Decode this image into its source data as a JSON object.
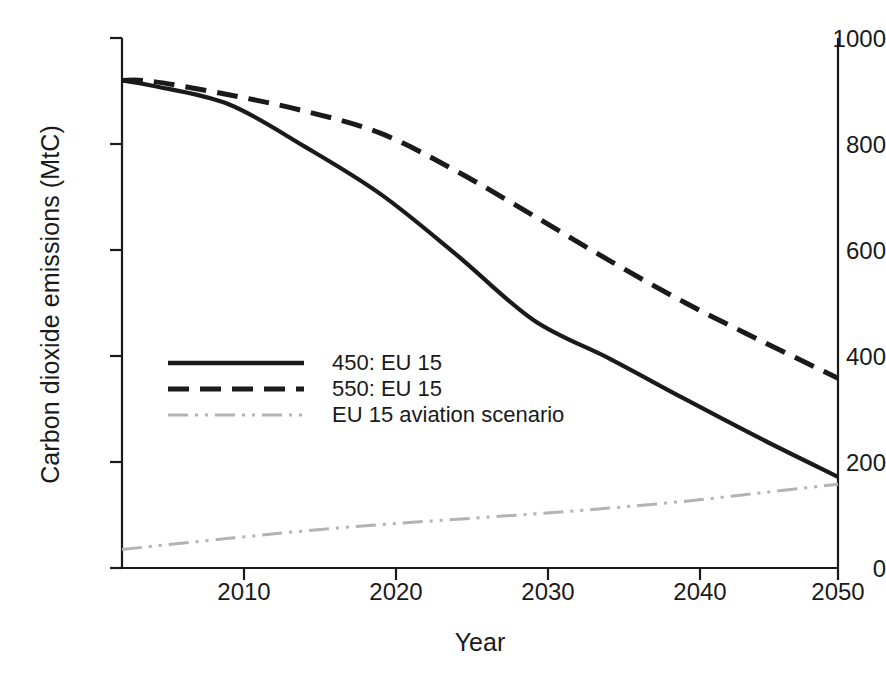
{
  "chart_data": {
    "type": "line",
    "title": "",
    "xlabel": "Year",
    "ylabel": "Carbon dioxide emissions (MtC)",
    "xlim": [
      2003,
      2050
    ],
    "ylim": [
      0,
      1000
    ],
    "grid": false,
    "legend_position": "center-left",
    "xticks": [
      "2010",
      "2020",
      "2030",
      "2040",
      "2050"
    ],
    "xtick_values": [
      2010,
      2020,
      2030,
      2040,
      2050
    ],
    "yticks": [
      "0",
      "200",
      "400",
      "600",
      "800",
      "1000"
    ],
    "ytick_values": [
      0,
      200,
      400,
      600,
      800,
      1000
    ],
    "x": [
      2003,
      2005,
      2010,
      2015,
      2020,
      2025,
      2030,
      2035,
      2040,
      2045,
      2050
    ],
    "series": [
      {
        "name": "450: EU 15",
        "style": "solid",
        "color": "#1a1a1a",
        "values": [
          920,
          910,
          875,
          795,
          705,
          590,
          468,
          395,
          318,
          243,
          172
        ]
      },
      {
        "name": "550: EU 15",
        "style": "dashed",
        "color": "#1a1a1a",
        "values": [
          920,
          918,
          893,
          862,
          820,
          748,
          665,
          580,
          500,
          428,
          358
        ]
      },
      {
        "name": "EU 15 aviation scenario",
        "style": "dash-dot-dot",
        "color": "#b3b3b3",
        "values": [
          35,
          41,
          56,
          70,
          82,
          92,
          102,
          113,
          126,
          142,
          158
        ]
      }
    ]
  },
  "axes": {
    "ytick_labels": [
      "1000",
      "800",
      "600",
      "400",
      "200",
      "0"
    ],
    "xtick_labels": [
      "2010",
      "2020",
      "2030",
      "2040",
      "2050"
    ],
    "xaxis_title": "Year",
    "yaxis_title": "Carbon dioxide emissions (MtC)"
  },
  "legend": {
    "entries": [
      {
        "label": "450: EU 15",
        "style": "solid",
        "color": "#1a1a1a"
      },
      {
        "label": "550: EU 15",
        "style": "dashed",
        "color": "#1a1a1a"
      },
      {
        "label": "EU 15 aviation scenario",
        "style": "dash-dot-dot",
        "color": "#b3b3b3"
      }
    ]
  },
  "colors": {
    "axis": "#1a1a1a",
    "background": "#ffffff",
    "series_primary": "#1a1a1a",
    "series_aviation": "#b3b3b3"
  }
}
